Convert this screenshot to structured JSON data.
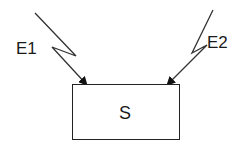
{
  "diagram": {
    "type": "block-diagram",
    "node": {
      "id": "S",
      "label": "S"
    },
    "inputs": [
      {
        "id": "E1",
        "label": "E1",
        "target": "S",
        "edge_style": "lightning-arrow"
      },
      {
        "id": "E2",
        "label": "E2",
        "target": "S",
        "edge_style": "lightning-arrow"
      }
    ],
    "colors": {
      "stroke": "#222222",
      "background": "#ffffff",
      "text": "#1a1a1a"
    }
  }
}
